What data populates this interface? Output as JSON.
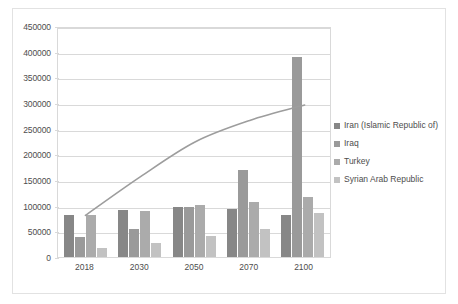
{
  "chart_data": {
    "type": "bar",
    "title": "",
    "subtitle": "",
    "xlabel": "",
    "ylabel": "",
    "categories": [
      "2018",
      "2030",
      "2050",
      "2070",
      "2100"
    ],
    "ylim": [
      0,
      450000
    ],
    "ytick_values": [
      0,
      50000,
      100000,
      150000,
      200000,
      250000,
      300000,
      350000,
      400000,
      450000
    ],
    "ytick_labels": [
      "0",
      "50000",
      "100000",
      "150000",
      "200000",
      "250000",
      "300000",
      "350000",
      "400000",
      "450000"
    ],
    "grid": true,
    "legend_position": "right",
    "series": [
      {
        "name": "Iran (Islamic Republic of)",
        "color": "#878787",
        "values": [
          82000,
          91000,
          98000,
          94000,
          82000
        ]
      },
      {
        "name": "Iraq",
        "color": "#9a9a9a",
        "values": [
          39000,
          55000,
          97000,
          169000,
          390000
        ]
      },
      {
        "name": "Turkey",
        "color": "#ababab",
        "values": [
          82000,
          90000,
          102000,
          108000,
          116000
        ]
      },
      {
        "name": "Syrian Arab Republic",
        "color": "#c2c2c2",
        "values": [
          17000,
          27000,
          40000,
          55000,
          86000
        ]
      }
    ],
    "overlay_line": {
      "name": "trend-curve",
      "color": "#9d9d9d",
      "x": [
        "2018",
        "2030",
        "2050",
        "2070",
        "2100"
      ],
      "values": [
        85000,
        160000,
        228000,
        270000,
        300000
      ]
    }
  },
  "legend": {
    "items": [
      {
        "label": "Iran (Islamic Republic of)",
        "color": "#878787"
      },
      {
        "label": "Iraq",
        "color": "#9a9a9a"
      },
      {
        "label": "Turkey",
        "color": "#ababab"
      },
      {
        "label": "Syrian Arab Republic",
        "color": "#c2c2c2"
      }
    ]
  }
}
